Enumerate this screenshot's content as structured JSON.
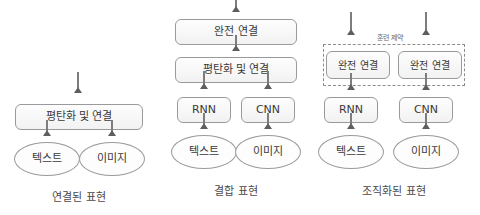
{
  "diagram": {
    "background_color": "#ffffff",
    "node_fill_color": "#fbfbfb",
    "node_border_color": "#9a9a9a",
    "arrow_color": "#7d7d7d",
    "dashed_border_color": "#8d8d8d"
  },
  "panels": [
    {
      "id": "joint",
      "caption": "연결된 표현",
      "nodes": {
        "fusion": "평탄화 및 연결",
        "text_input": "텍스트",
        "image_input": "이미지"
      }
    },
    {
      "id": "combined",
      "caption": "결합 표현",
      "nodes": {
        "fully_connected": "완전 연결",
        "fusion": "평탄화 및 연결",
        "rnn": "RNN",
        "cnn": "CNN",
        "text_input": "텍스트",
        "image_input": "이미지"
      }
    },
    {
      "id": "coordinated",
      "caption": "조직화된 표현",
      "constraint_label": "훈련 제약",
      "nodes": {
        "fully_connected_left": "완전 연결",
        "fully_connected_right": "완전 연결",
        "rnn": "RNN",
        "cnn": "CNN",
        "text_input": "텍스트",
        "image_input": "이미지"
      }
    }
  ]
}
